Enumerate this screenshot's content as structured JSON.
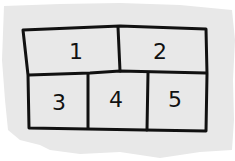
{
  "diagram": {
    "type": "grid-layout-sketch",
    "background_color": "#ffffff",
    "paper_color": "#e8e8e8",
    "ink_color": "#111111",
    "rows": [
      {
        "cells": [
          {
            "label": "1"
          },
          {
            "label": "2"
          }
        ]
      },
      {
        "cells": [
          {
            "label": "3"
          },
          {
            "label": "4"
          },
          {
            "label": "5"
          }
        ]
      }
    ]
  }
}
